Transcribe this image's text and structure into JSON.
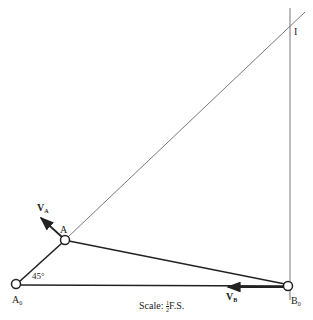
{
  "diagram": {
    "type": "four-bar linkage instant center construction",
    "points": {
      "A0": {
        "label": "A",
        "sub": "0"
      },
      "A": {
        "label": "A"
      },
      "B0": {
        "label": "B",
        "sub": "0"
      },
      "I": {
        "label": "I"
      }
    },
    "vectors": {
      "VA": {
        "label": "V",
        "sub": "A"
      },
      "VB": {
        "label": "V",
        "sub": "B"
      }
    },
    "angle": "45°",
    "scale": {
      "text": "Scale: ",
      "num": "1",
      "den": "2",
      "suffix": "F.S."
    },
    "colors": {
      "line": "#222222",
      "thin": "#555555",
      "background": "#ffffff"
    }
  }
}
